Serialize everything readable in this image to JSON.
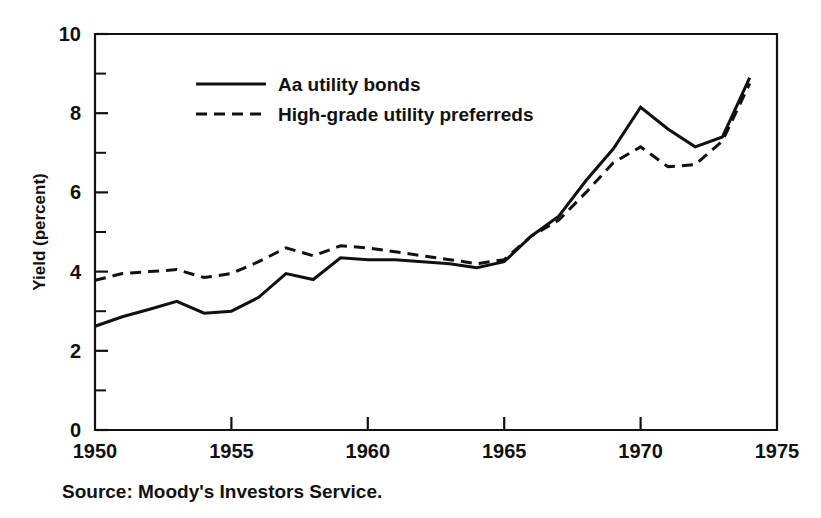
{
  "chart_data": {
    "type": "line",
    "title": "",
    "xlabel": "",
    "ylabel": "Yield (percent)",
    "xlim": [
      1950,
      1975
    ],
    "ylim": [
      0,
      10
    ],
    "grid": false,
    "legend_position": "upper-left-inside",
    "x_ticks": [
      "1950",
      "1955",
      "1960",
      "1965",
      "1970",
      "1975"
    ],
    "x_tick_values": [
      1950,
      1955,
      1960,
      1965,
      1970,
      1975
    ],
    "x_minor_interval": 1,
    "y_ticks": [
      "0",
      "2",
      "4",
      "6",
      "8",
      "10"
    ],
    "y_tick_values": [
      0,
      2,
      4,
      6,
      8,
      10
    ],
    "y_minor_interval": 1,
    "x": [
      1950,
      1951,
      1952,
      1953,
      1954,
      1955,
      1956,
      1957,
      1958,
      1959,
      1960,
      1961,
      1962,
      1963,
      1964,
      1965,
      1966,
      1967,
      1968,
      1969,
      1970,
      1971,
      1972,
      1973,
      1974
    ],
    "series": [
      {
        "name": "Aa utility bonds",
        "style": "solid",
        "color": "#111111",
        "values": [
          2.62,
          2.86,
          3.05,
          3.25,
          2.95,
          3.0,
          3.35,
          3.95,
          3.8,
          4.35,
          4.3,
          4.3,
          4.25,
          4.2,
          4.1,
          4.25,
          4.9,
          5.4,
          6.3,
          7.1,
          8.15,
          7.6,
          7.15,
          7.4,
          8.9
        ]
      },
      {
        "name": "High-grade utility preferreds",
        "style": "dashed",
        "color": "#111111",
        "values": [
          3.78,
          3.95,
          4.0,
          4.05,
          3.85,
          3.95,
          4.25,
          4.6,
          4.4,
          4.65,
          4.6,
          4.5,
          4.4,
          4.3,
          4.2,
          4.3,
          4.9,
          5.3,
          6.0,
          6.75,
          7.15,
          6.65,
          6.7,
          7.3,
          8.75
        ]
      }
    ],
    "source_note": "Source: Moody's Investors Service."
  },
  "legend": {
    "entries": [
      {
        "label": "Aa utility bonds",
        "style": "solid"
      },
      {
        "label": "High-grade utility preferreds",
        "style": "dashed"
      }
    ]
  },
  "footer": {
    "source": "Source: Moody's Investors Service."
  },
  "axes": {
    "y_title": "Yield (percent)"
  }
}
